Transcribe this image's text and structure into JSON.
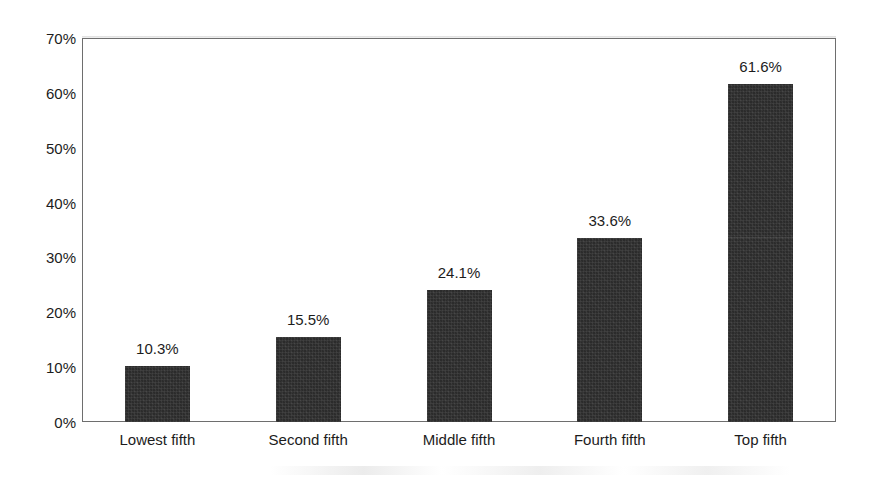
{
  "chart_data": {
    "type": "bar",
    "title": "",
    "subtitle": "",
    "xlabel": "",
    "ylabel": "",
    "categories": [
      "Lowest fifth",
      "Second fifth",
      "Middle fifth",
      "Fourth fifth",
      "Top fifth"
    ],
    "values": [
      10.3,
      15.5,
      24.1,
      33.6,
      61.6
    ],
    "value_labels": [
      "10.3%",
      "15.5%",
      "24.1%",
      "33.6%",
      "61.6%"
    ],
    "ylim": [
      0,
      70
    ],
    "y_tick_values": [
      0,
      10,
      20,
      30,
      40,
      50,
      60,
      70
    ],
    "y_tick_labels": [
      "0%",
      "10%",
      "20%",
      "30%",
      "40%",
      "50%",
      "60%",
      "70%"
    ],
    "grid": false,
    "legend": false,
    "legend_position": "none",
    "bar_color": "#2b2b2b",
    "plot_border_color": "#6e6e6e",
    "background_color": "#ffffff",
    "text_color": "#1c1c1c"
  }
}
